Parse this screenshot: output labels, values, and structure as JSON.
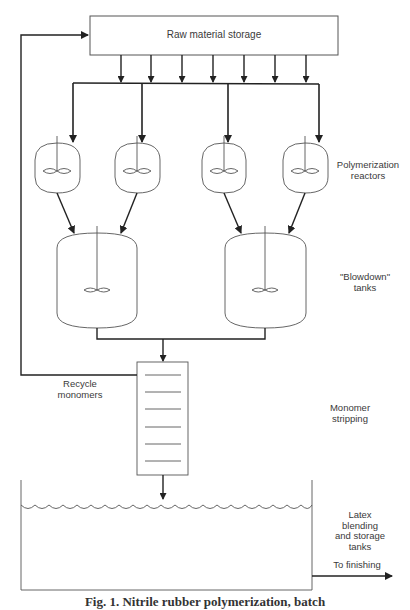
{
  "diagram": {
    "title_box": {
      "label": "Raw material storage"
    },
    "labels": {
      "reactors": "Polymerization\nreactors",
      "blowdown": "\"Blowdown\"\ntanks",
      "recycle": "Recycle\nmonomers",
      "stripping": "Monomer\nstripping",
      "latex": "Latex\nblending\nand storage\ntanks",
      "finishing": "To finishing"
    },
    "caption": "Fig. 1. Nitrile rubber polymerization, batch",
    "nodes": [
      {
        "id": "raw-material-storage",
        "type": "box",
        "label": "Raw material storage"
      },
      {
        "id": "reactor-1",
        "type": "reactor"
      },
      {
        "id": "reactor-2",
        "type": "reactor"
      },
      {
        "id": "reactor-3",
        "type": "reactor"
      },
      {
        "id": "reactor-4",
        "type": "reactor"
      },
      {
        "id": "blowdown-tank-1",
        "type": "tank"
      },
      {
        "id": "blowdown-tank-2",
        "type": "tank"
      },
      {
        "id": "stripping-column",
        "type": "column",
        "trays": 6
      },
      {
        "id": "latex-tank",
        "type": "tank"
      }
    ],
    "edges": [
      {
        "from": "raw-material-storage",
        "to": "feed-header",
        "count": 7
      },
      {
        "from": "feed-header",
        "to": "reactor-1"
      },
      {
        "from": "feed-header",
        "to": "reactor-2"
      },
      {
        "from": "feed-header",
        "to": "reactor-3"
      },
      {
        "from": "feed-header",
        "to": "reactor-4"
      },
      {
        "from": "reactor-1",
        "to": "blowdown-tank-1"
      },
      {
        "from": "reactor-2",
        "to": "blowdown-tank-1"
      },
      {
        "from": "reactor-3",
        "to": "blowdown-tank-2"
      },
      {
        "from": "reactor-4",
        "to": "blowdown-tank-2"
      },
      {
        "from": "blowdown-tank-1",
        "to": "stripping-column"
      },
      {
        "from": "blowdown-tank-2",
        "to": "stripping-column"
      },
      {
        "from": "stripping-column",
        "to": "raw-material-storage",
        "label": "Recycle monomers"
      },
      {
        "from": "stripping-column",
        "to": "latex-tank"
      },
      {
        "from": "latex-tank",
        "to": "finishing",
        "label": "To finishing"
      }
    ]
  }
}
